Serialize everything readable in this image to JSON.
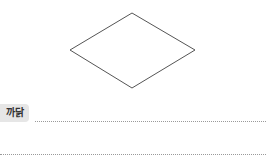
{
  "figure": {
    "shape": "rhombus",
    "stroke_color": "#555555"
  },
  "answer": {
    "label": "까닭",
    "lines": 2
  }
}
